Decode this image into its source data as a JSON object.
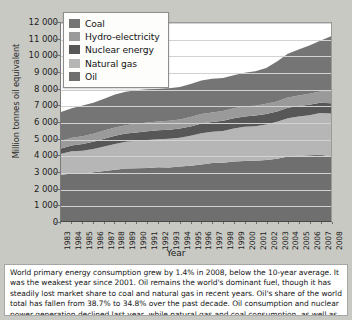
{
  "chart_data": {
    "type": "area",
    "stacked": true,
    "title": "",
    "xlabel": "Year",
    "ylabel": "Million tonnes oil equivalent",
    "ylim": [
      0,
      12000
    ],
    "ytick_labels": [
      "12 000",
      "11 000",
      "10 000",
      "9 000",
      "8 000",
      "7 000",
      "6 000",
      "5 000",
      "4 000",
      "3 000",
      "2 000",
      "1 000",
      "0"
    ],
    "ytick_values": [
      12000,
      11000,
      10000,
      9000,
      8000,
      7000,
      6000,
      5000,
      4000,
      3000,
      2000,
      1000,
      0
    ],
    "grid": true,
    "legend_position": "top-left",
    "categories": [
      1983,
      1984,
      1985,
      1986,
      1987,
      1988,
      1989,
      1990,
      1991,
      1992,
      1993,
      1994,
      1995,
      1996,
      1997,
      1998,
      1999,
      2000,
      2001,
      2002,
      2003,
      2004,
      2005,
      2006,
      2007,
      2008
    ],
    "xtick_labels": [
      "1983",
      "1984",
      "1985",
      "1986",
      "1987",
      "1988",
      "1989",
      "1990",
      "1991",
      "1992",
      "1993",
      "1994",
      "1995",
      "1996",
      "1997",
      "1998",
      "1999",
      "2000",
      "2001",
      "2002",
      "2003",
      "2004",
      "2005",
      "2006",
      "2007",
      "2008"
    ],
    "series": [
      {
        "name": "Oil",
        "color": "#6f6f6f",
        "stack_order": 1,
        "values": [
          2800,
          2880,
          2870,
          2960,
          3030,
          3110,
          3180,
          3200,
          3210,
          3250,
          3240,
          3300,
          3350,
          3430,
          3510,
          3530,
          3610,
          3640,
          3650,
          3690,
          3770,
          3910,
          3960,
          3990,
          4020,
          3930
        ]
      },
      {
        "name": "Natural gas",
        "color": "#b6b6b6",
        "stack_order": 2,
        "values": [
          1280,
          1340,
          1390,
          1410,
          1490,
          1560,
          1620,
          1660,
          1700,
          1710,
          1740,
          1750,
          1810,
          1890,
          1900,
          1930,
          1990,
          2070,
          2100,
          2160,
          2240,
          2310,
          2370,
          2420,
          2520,
          2580
        ]
      },
      {
        "name": "Nuclear energy",
        "color": "#575757",
        "stack_order": 3,
        "values": [
          310,
          350,
          400,
          430,
          460,
          490,
          500,
          510,
          530,
          540,
          550,
          560,
          570,
          590,
          590,
          610,
          630,
          630,
          640,
          640,
          630,
          640,
          640,
          640,
          630,
          620
        ]
      },
      {
        "name": "Hydro-electricity",
        "color": "#9a9a9a",
        "stack_order": 4,
        "values": [
          460,
          470,
          480,
          490,
          500,
          510,
          510,
          520,
          530,
          530,
          550,
          540,
          570,
          580,
          580,
          590,
          600,
          610,
          600,
          610,
          600,
          630,
          640,
          660,
          680,
          720
        ]
      },
      {
        "name": "Coal",
        "color": "#757575",
        "stack_order": 5,
        "values": [
          1750,
          1800,
          1860,
          1880,
          1930,
          2000,
          2020,
          2030,
          2010,
          1970,
          1960,
          1970,
          2000,
          2030,
          2040,
          2010,
          2000,
          2030,
          2080,
          2170,
          2430,
          2640,
          2790,
          2930,
          3080,
          3340
        ]
      }
    ],
    "totals": [
      6600,
      6840,
      7000,
      7170,
      7410,
      7670,
      7830,
      7920,
      7980,
      8000,
      8040,
      8120,
      8300,
      8520,
      8620,
      8670,
      8830,
      8980,
      9070,
      9270,
      9670,
      10130,
      10400,
      10640,
      10930,
      11190
    ]
  },
  "legend": {
    "items": [
      {
        "label": "Coal",
        "color": "#757575"
      },
      {
        "label": "Hydro-electricity",
        "color": "#9a9a9a"
      },
      {
        "label": "Nuclear energy",
        "color": "#575757"
      },
      {
        "label": "Natural gas",
        "color": "#b6b6b6"
      },
      {
        "label": "Oil",
        "color": "#6f6f6f"
      }
    ]
  },
  "caption": {
    "text": "World primary energy consumption grew by 1.4% in 2008, below the 10-year average. It was the weakest year since 2001. Oil remains the world's dominant fuel, though it has steadily lost market share to coal and natural gas in recent years. Oil's share of the world total has fallen from 38.7% to 34.8% over the past decade. Oil consumption and nuclear power generation declined last year, while natural gas and coal consumption, as well as hydro-electric generation, increased."
  }
}
